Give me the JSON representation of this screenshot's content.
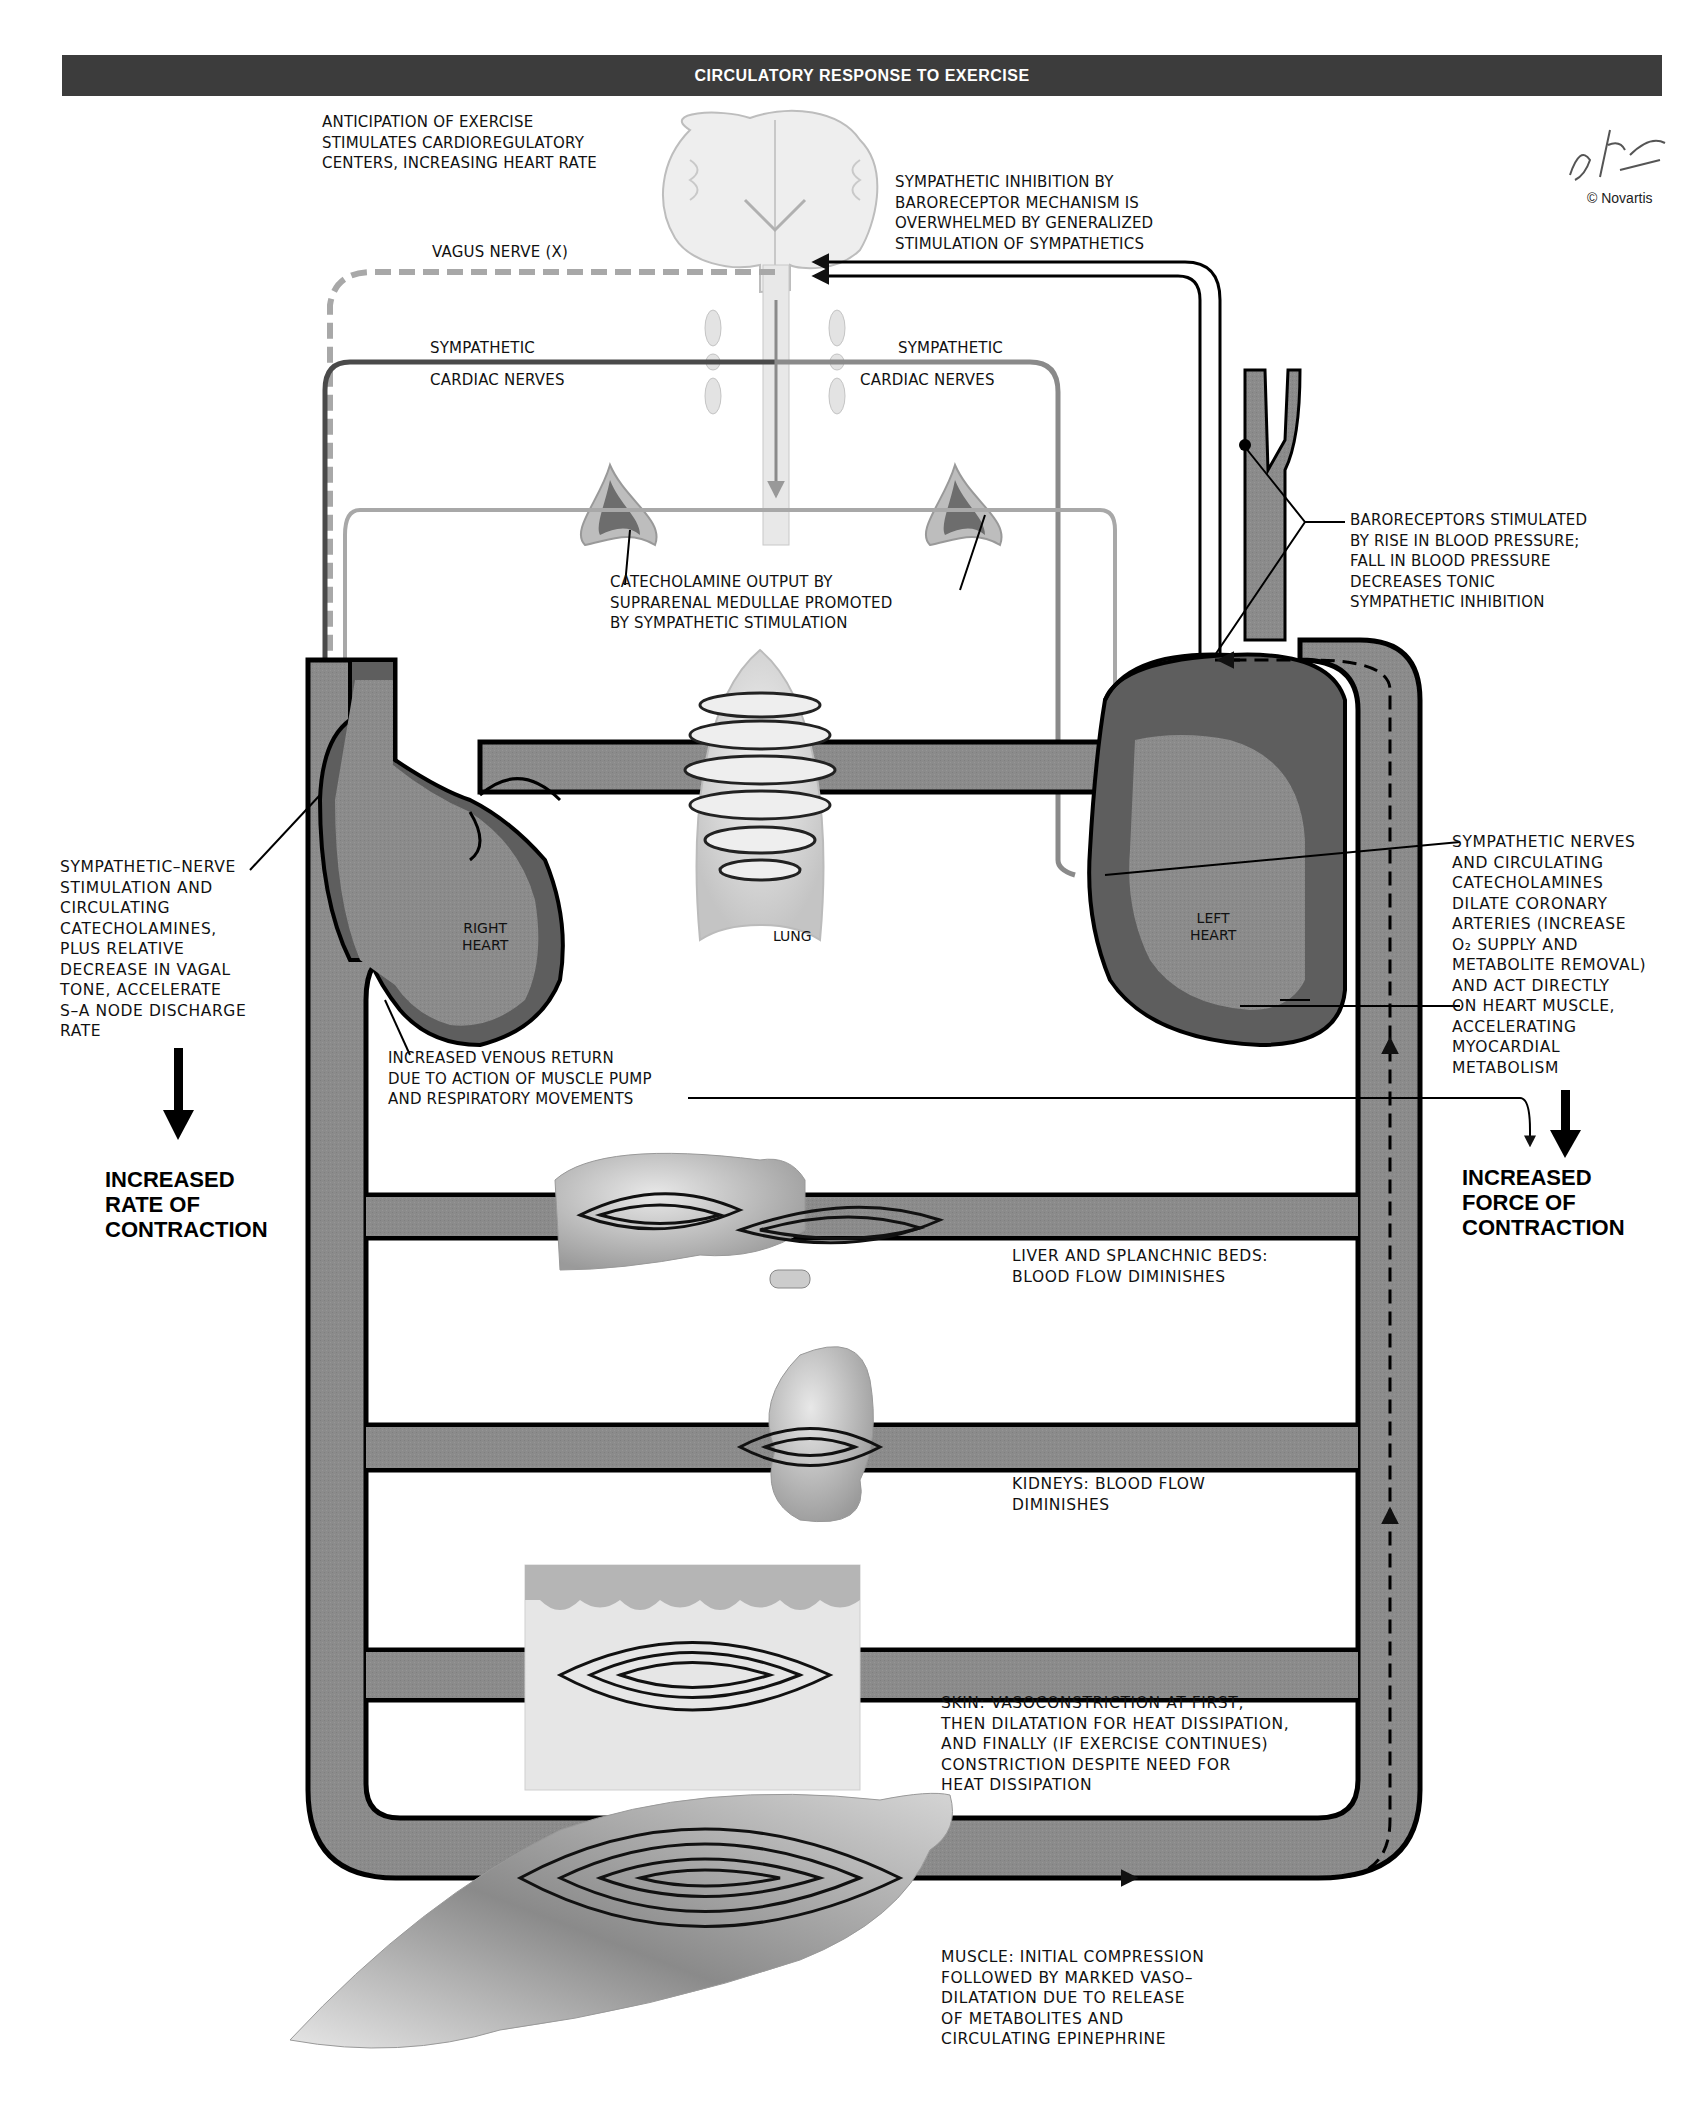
{
  "header": {
    "title": "CIRCULATORY RESPONSE TO EXERCISE"
  },
  "signature": {
    "artist": "F. Netter M.D.",
    "copyright": "© Novartis"
  },
  "labels": {
    "anticipation": "ANTICIPATION OF EXERCISE\nSTIMULATES CARDIOREGULATORY\nCENTERS, INCREASING HEART RATE",
    "sympathetic_inhibition": "SYMPATHETIC INHIBITION BY\nBARORECEPTOR MECHANISM IS\nOVERWHELMED BY GENERALIZED\nSTIMULATION OF SYMPATHETICS",
    "vagus_nerve": "VAGUS NERVE (X)",
    "sympathetic_left_1": "SYMPATHETIC",
    "sympathetic_left_2": "CARDIAC NERVES",
    "sympathetic_right_1": "SYMPATHETIC",
    "sympathetic_right_2": "CARDIAC NERVES",
    "catecholamine_output": "CATECHOLAMINE OUTPUT BY\nSUPRARENAL MEDULLAE PROMOTED\nBY SYMPATHETIC STIMULATION",
    "baroreceptors": "BARORECEPTORS STIMULATED\nBY RISE IN BLOOD PRESSURE;\nFALL IN BLOOD PRESSURE\nDECREASES TONIC\nSYMPATHETIC INHIBITION",
    "sa_node": "SYMPATHETIC–NERVE\nSTIMULATION AND\nCIRCULATING\nCATECHOLAMINES,\nPLUS RELATIVE\nDECREASE IN VAGAL\nTONE, ACCELERATE\nS–A NODE DISCHARGE\nRATE",
    "coronary": "SYMPATHETIC NERVES\nAND CIRCULATING\nCATECHOLAMINES\nDILATE CORONARY\nARTERIES (INCREASE\nO₂ SUPPLY AND\nMETABOLITE REMOVAL)\nAND ACT DIRECTLY\nON HEART MUSCLE,\nACCELERATING\nMYOCARDIAL\nMETABOLISM",
    "venous_return": "INCREASED VENOUS RETURN\nDUE TO ACTION OF MUSCLE PUMP\nAND RESPIRATORY MOVEMENTS",
    "liver": "LIVER AND SPLANCHNIC BEDS:\nBLOOD FLOW DIMINISHES",
    "kidneys": "KIDNEYS: BLOOD FLOW\nDIMINISHES",
    "skin": "SKIN: VASOCONSTRICTION AT FIRST,\nTHEN DILATATION FOR HEAT DISSIPATION,\nAND FINALLY (IF EXERCISE CONTINUES)\nCONSTRICTION DESPITE NEED FOR\nHEAT DISSIPATION",
    "muscle": "MUSCLE: INITIAL COMPRESSION\nFOLLOWED BY MARKED VASO–\nDILATATION DUE TO RELEASE\nOF METABOLITES AND\nCIRCULATING EPINEPHRINE"
  },
  "organs": {
    "right_heart": "RIGHT\nHEART",
    "left_heart": "LEFT\nHEART",
    "lung": "LUNG"
  },
  "outcomes": {
    "rate": "INCREASED\nRATE OF\nCONTRACTION",
    "force": "INCREASED\nFORCE OF\nCONTRACTION"
  },
  "colors": {
    "vessel": "#8a8a8a",
    "vessel_outline": "#0a0a0a",
    "myocardium": "#5e5e5e",
    "header_bg": "#3c3c3c",
    "nerve_dark": "#4a4a4a",
    "nerve_light": "#9a9a9a"
  }
}
